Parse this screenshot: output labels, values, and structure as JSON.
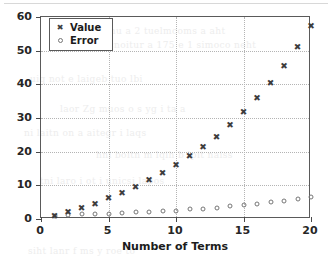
{
  "figure": {
    "legend": {
      "position": "upper-left-inside",
      "entries": [
        {
          "label": "Value",
          "marker": "x-marker-icon"
        },
        {
          "label": "Error",
          "marker": "circle-marker-icon"
        }
      ]
    },
    "axes": {
      "xlabel": "Number of Terms",
      "ylabel": "",
      "xticks": [
        "0",
        "5",
        "10",
        "15",
        "20"
      ],
      "yticks": [
        "0",
        "10",
        "20",
        "30",
        "40",
        "50",
        "60"
      ]
    },
    "colors": {
      "value_marker": "#3d3d3d",
      "error_marker": "#767676",
      "axis": "#5a5a5a",
      "grid": "#b4b4b4",
      "background": "#ffffff"
    },
    "scan_bleed_text": [
      "rasnoitsnu a  2 tuelmcoms a  aht",
      "precnoitur a  175 e 1  simoco neht",
      "uiq not  e  laigeb tuo lbi",
      "laor Zg muos  o  s  yg  i  ta a",
      "ni laitn on  a  aitegr  i  laqs",
      "hni boitn  m  lqih b  lpit  naiss",
      "tni laro i  ot  i  unicsi  lapos",
      "siht lanr  f  ms  y roe  to"
    ]
  },
  "chart_data": {
    "type": "scatter",
    "title": "",
    "xlabel": "Number of Terms",
    "ylabel": "",
    "xlim": [
      0,
      20
    ],
    "ylim": [
      0,
      60
    ],
    "grid": true,
    "legend_position": "upper left",
    "x": [
      1,
      2,
      3,
      4,
      5,
      6,
      7,
      8,
      9,
      10,
      11,
      12,
      13,
      14,
      15,
      16,
      17,
      18,
      19,
      20
    ],
    "series": [
      {
        "name": "Value",
        "marker": "x",
        "values": [
          1.0,
          2.0,
          3.2,
          4.6,
          6.2,
          7.7,
          9.6,
          11.5,
          13.6,
          16.0,
          18.6,
          21.4,
          24.5,
          27.9,
          31.7,
          35.9,
          40.5,
          45.4,
          51.0,
          57.2
        ]
      },
      {
        "name": "Error",
        "marker": "o",
        "values": [
          1.0,
          1.3,
          1.4,
          1.5,
          1.6,
          1.8,
          2.0,
          2.2,
          2.3,
          2.5,
          2.9,
          3.1,
          3.4,
          3.8,
          4.2,
          4.6,
          5.0,
          5.4,
          5.9,
          6.5
        ]
      }
    ]
  }
}
